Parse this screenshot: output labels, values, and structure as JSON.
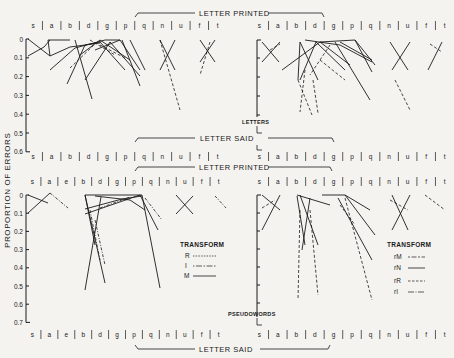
{
  "figure": {
    "ylabel": "PROPORTION OF ERRORS",
    "bracket_printed": "LETTER PRINTED",
    "bracket_said": "LETTER SAID",
    "panel_labels": {
      "letters": "LETTERS",
      "pseudowords": "PSEUDOWORDS"
    }
  },
  "legends": {
    "left": {
      "title": "TRANSFORM",
      "items": [
        {
          "label": "R",
          "style": "dotted"
        },
        {
          "label": "I",
          "style": "dashdot"
        },
        {
          "label": "M",
          "style": "solid"
        }
      ]
    },
    "right": {
      "title": "TRANSFORM",
      "items": [
        {
          "label": "rM",
          "style": "dashdot"
        },
        {
          "label": "rN",
          "style": "solid"
        },
        {
          "label": "rR",
          "style": "dashed"
        },
        {
          "label": "rI",
          "style": "dashdot2"
        }
      ]
    }
  },
  "chart_data": [
    {
      "type": "line",
      "title": "LETTERS (left)",
      "ylabel": "PROPORTION OF ERRORS",
      "ylim": [
        0,
        0.6
      ],
      "yticks": [
        "0",
        "0.1",
        "0.2",
        "0.3",
        "0.4",
        "0.5",
        "0.6"
      ],
      "top_axis_label": "LETTER PRINTED",
      "bottom_axis_label": "LETTER SAID",
      "categories_top": [
        "s",
        "a",
        "b",
        "d",
        "g",
        "p",
        "q",
        "n",
        "u",
        "f",
        "t"
      ],
      "categories_bottom": [
        "s",
        "a",
        "b",
        "d",
        "g",
        "p",
        "q",
        "n",
        "u",
        "f",
        "t"
      ]
    },
    {
      "type": "line",
      "title": "LETTERS (right)",
      "ylim": [
        0,
        0.6
      ],
      "categories_top": [
        "s",
        "a",
        "b",
        "d",
        "g",
        "p",
        "q",
        "n",
        "u",
        "f",
        "t"
      ],
      "categories_bottom": [
        "s",
        "a",
        "b",
        "d",
        "g",
        "p",
        "q",
        "n",
        "u",
        "f",
        "t"
      ]
    },
    {
      "type": "line",
      "title": "PSEUDOWORDS (left)",
      "ylim": [
        0,
        0.7
      ],
      "yticks": [
        "0",
        "0.1",
        "0.2",
        "0.3",
        "0.4",
        "0.5",
        "0.6",
        "0.7"
      ],
      "categories_top": [
        "s",
        "a",
        "e",
        "b",
        "d",
        "g",
        "p",
        "q",
        "n",
        "u",
        "f",
        "t"
      ],
      "categories_bottom": [
        "s",
        "a",
        "e",
        "b",
        "d",
        "g",
        "p",
        "q",
        "n",
        "u",
        "f",
        "t"
      ],
      "legend": [
        "R",
        "I",
        "M"
      ]
    },
    {
      "type": "line",
      "title": "PSEUDOWORDS (right)",
      "ylim": [
        0,
        0.7
      ],
      "categories_top": [
        "s",
        "a",
        "b",
        "d",
        "g",
        "p",
        "q",
        "n",
        "u",
        "f",
        "t"
      ],
      "categories_bottom": [
        "s",
        "a",
        "b",
        "d",
        "g",
        "p",
        "q",
        "n",
        "u",
        "f",
        "t"
      ],
      "legend": [
        "rM",
        "rN",
        "rR",
        "rI"
      ]
    }
  ],
  "rows": {
    "letters_top_left": [
      "s",
      "a",
      "b",
      "d",
      "g",
      "p",
      "q",
      "n",
      "u",
      "f",
      "t"
    ],
    "letters_top_right": [
      "s",
      "a",
      "b",
      "d",
      "g",
      "p",
      "q",
      "n",
      "u",
      "f",
      "t"
    ],
    "letters_bottom_left": [
      "s",
      "a",
      "b",
      "d",
      "g",
      "p",
      "q",
      "n",
      "u",
      "f",
      "t"
    ],
    "letters_bottom_right": [
      "s",
      "a",
      "b",
      "d",
      "g",
      "p",
      "q",
      "n",
      "u",
      "f",
      "t"
    ],
    "pseudo_top_left": [
      "s",
      "a",
      "e",
      "b",
      "d",
      "g",
      "p",
      "q",
      "n",
      "u",
      "f",
      "t"
    ],
    "pseudo_top_right": [
      "s",
      "a",
      "b",
      "d",
      "g",
      "p",
      "q",
      "n",
      "u",
      "f",
      "t"
    ],
    "pseudo_bottom_left": [
      "s",
      "a",
      "e",
      "b",
      "d",
      "g",
      "p",
      "q",
      "n",
      "u",
      "f",
      "t"
    ],
    "pseudo_bottom_right": [
      "s",
      "a",
      "b",
      "d",
      "g",
      "p",
      "q",
      "n",
      "u",
      "f",
      "t"
    ]
  },
  "yticks_letters": [
    "0",
    "0.1",
    "0.2",
    "0.3",
    "0.4",
    "0.5",
    "0.6"
  ],
  "yticks_pseudo": [
    "0",
    "0.1",
    "0.2",
    "0.3",
    "0.4",
    "0.5",
    "0.6",
    "0.7"
  ]
}
